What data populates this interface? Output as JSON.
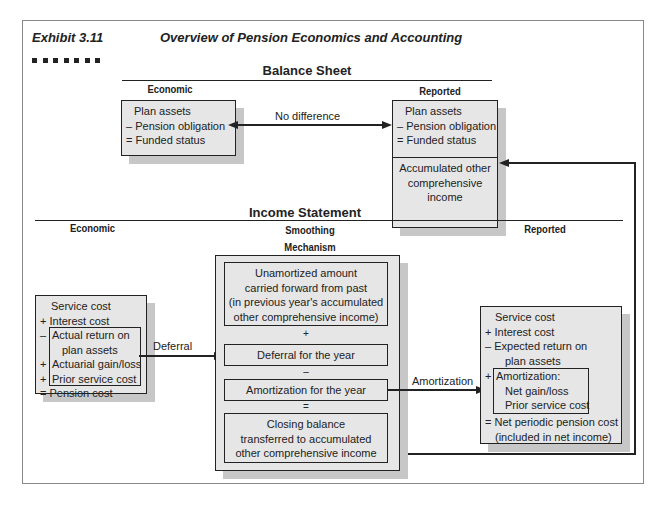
{
  "exhibit": {
    "number": "Exhibit 3.11",
    "title": "Overview of Pension Economics and Accounting"
  },
  "balance_sheet": {
    "heading": "Balance Sheet",
    "economic_label": "Economic",
    "reported_label": "Reported",
    "economic_box": [
      "Plan assets",
      "– Pension obligation",
      "= Funded status"
    ],
    "reported_box": [
      "Plan assets",
      "– Pension obligation",
      "= Funded status"
    ],
    "reported_aoci": [
      "Accumulated other",
      "comprehensive",
      "income"
    ],
    "arrow_label": "No difference"
  },
  "income_statement": {
    "heading": "Income Statement",
    "economic_label": "Economic",
    "smoothing_label": [
      "Smoothing",
      "Mechanism"
    ],
    "reported_label": "Reported",
    "economic_box": {
      "top": [
        "Service cost",
        "+ Interest cost"
      ],
      "inner": [
        "Actual return on",
        "plan assets",
        "Actuarial gain/loss",
        "Prior service cost"
      ],
      "inner_signs": [
        "–",
        "",
        "+",
        "+"
      ],
      "bottom": "= Pension cost"
    },
    "deferral_label": "Deferral",
    "smoothing_boxes": {
      "unamortized": [
        "Unamortized amount",
        "carried forward from past",
        "(in previous year's accumulated",
        "other comprehensive income)"
      ],
      "op1": "+",
      "deferral": "Deferral for the year",
      "op2": "–",
      "amortization": "Amortization for the year",
      "op3": "=",
      "closing": [
        "Closing balance",
        "transferred to accumulated",
        "other comprehensive income"
      ]
    },
    "amortization_label": "Amortization",
    "reported_box": {
      "top": [
        "Service cost",
        "+ Interest cost",
        "– Expected return on",
        "plan assets"
      ],
      "inner_sign": "+",
      "inner": [
        "Amortization:",
        "Net gain/loss",
        "Prior service cost"
      ],
      "bottom": [
        "= Net periodic pension cost",
        "(included in net income)"
      ]
    }
  }
}
